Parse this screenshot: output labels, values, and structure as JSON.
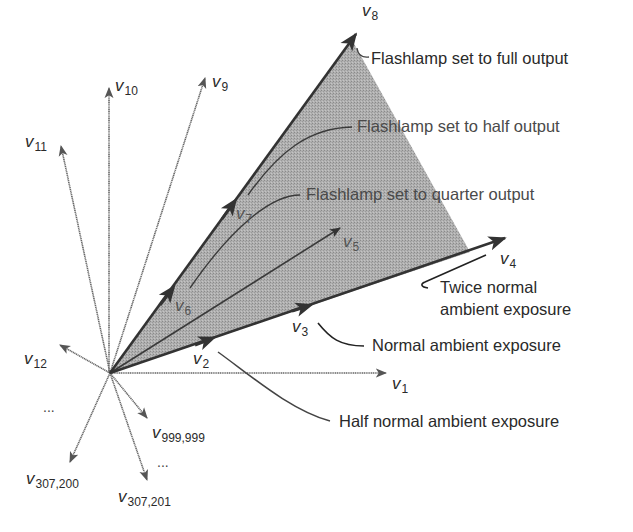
{
  "figure": {
    "type": "vector space diagram",
    "origin": [
      110,
      373
    ],
    "shaded_region": {
      "description": "cone spanned by v4 and v8",
      "color": "#a9a9a9"
    }
  },
  "vectors": [
    {
      "id": "v1",
      "name": "v",
      "sub": "1",
      "tip": [
        385,
        373
      ]
    },
    {
      "id": "v2",
      "name": "v",
      "sub": "2",
      "tip": [
        205,
        343
      ]
    },
    {
      "id": "v3",
      "name": "v",
      "sub": "3",
      "tip": [
        320,
        310
      ]
    },
    {
      "id": "v4",
      "name": "v",
      "sub": "4",
      "tip": [
        505,
        238
      ]
    },
    {
      "id": "v5",
      "name": "v",
      "sub": "5",
      "tip": [
        340,
        228
      ]
    },
    {
      "id": "v6",
      "name": "v",
      "sub": "6",
      "tip": [
        168,
        296
      ]
    },
    {
      "id": "v7",
      "name": "v",
      "sub": "7",
      "tip": [
        236,
        205
      ]
    },
    {
      "id": "v8",
      "name": "v",
      "sub": "8",
      "tip": [
        356,
        34
      ]
    },
    {
      "id": "v9",
      "name": "v",
      "sub": "9",
      "tip": [
        205,
        78
      ]
    },
    {
      "id": "v10",
      "name": "v",
      "sub": "10",
      "tip": [
        109,
        88
      ]
    },
    {
      "id": "v11",
      "name": "v",
      "sub": "11",
      "tip": [
        61,
        146
      ]
    },
    {
      "id": "v12",
      "name": "v",
      "sub": "12",
      "tip": [
        60,
        345
      ]
    },
    {
      "id": "v999999",
      "name": "v",
      "sub": "999,999",
      "tip": [
        147,
        418
      ]
    },
    {
      "id": "v307200",
      "name": "v",
      "sub": "307,200",
      "tip": [
        70,
        462
      ]
    },
    {
      "id": "v307201",
      "name": "v",
      "sub": "307,201",
      "tip": [
        147,
        480
      ]
    }
  ],
  "labels": {
    "v1": {
      "name": "v",
      "sub": "1"
    },
    "v2": {
      "name": "v",
      "sub": "2"
    },
    "v3": {
      "name": "v",
      "sub": "3"
    },
    "v4": {
      "name": "v",
      "sub": "4"
    },
    "v5": {
      "name": "v",
      "sub": "5"
    },
    "v6": {
      "name": "v",
      "sub": "6"
    },
    "v7": {
      "name": "v",
      "sub": "7"
    },
    "v8": {
      "name": "v",
      "sub": "8"
    },
    "v9": {
      "name": "v",
      "sub": "9"
    },
    "v10": {
      "name": "v",
      "sub": "10"
    },
    "v11": {
      "name": "v",
      "sub": "11"
    },
    "v12": {
      "name": "v",
      "sub": "12"
    },
    "v999999": {
      "name": "v",
      "sub": "999,999"
    },
    "v307200": {
      "name": "v",
      "sub": "307,200"
    },
    "v307201": {
      "name": "v",
      "sub": "307,201"
    },
    "ellipsis": "..."
  },
  "annotations": {
    "full": "Flashlamp set to full output",
    "half": "Flashlamp set to half output",
    "quarter": "Flashlamp set to quarter output",
    "twice_line1": "Twice normal",
    "twice_line2": "ambient exposure",
    "normal": "Normal ambient exposure",
    "half_normal": "Half normal ambient exposure"
  }
}
